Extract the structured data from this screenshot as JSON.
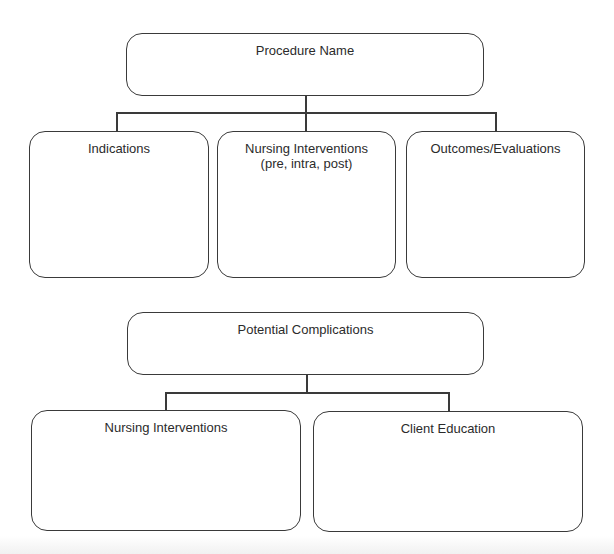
{
  "diagram": {
    "top": {
      "title": "Procedure Name",
      "children": [
        {
          "label": "Indications"
        },
        {
          "label": "Nursing Interventions\n(pre, intra, post)"
        },
        {
          "label": "Outcomes/Evaluations"
        }
      ]
    },
    "bottom": {
      "title": "Potential Complications",
      "children": [
        {
          "label": "Nursing Interventions"
        },
        {
          "label": "Client Education"
        }
      ]
    }
  },
  "colors": {
    "stroke": "#3a3a3a",
    "text": "#2b2b2b",
    "background": "#ffffff"
  }
}
